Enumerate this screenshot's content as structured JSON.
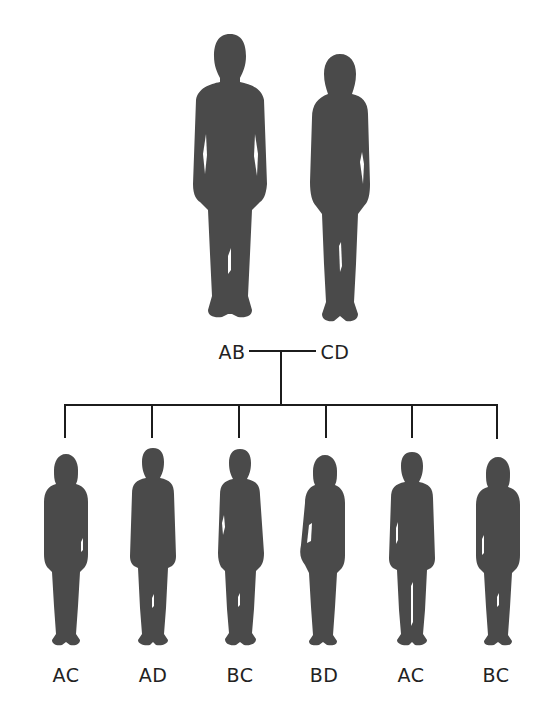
{
  "colors": {
    "silhouette": "#4a4a4a",
    "line": "#1c1c1c",
    "text": "#222222",
    "background": "#ffffff"
  },
  "parents": {
    "father": {
      "icon": "male-adult-silhouette",
      "genotype": "AB"
    },
    "mother": {
      "icon": "female-adult-silhouette",
      "genotype": "CD"
    }
  },
  "children": [
    {
      "icon": "girl-silhouette",
      "genotype": "AC"
    },
    {
      "icon": "boy-silhouette",
      "genotype": "AD"
    },
    {
      "icon": "boy-silhouette",
      "genotype": "BC"
    },
    {
      "icon": "girl-silhouette",
      "genotype": "BD"
    },
    {
      "icon": "boy-silhouette",
      "genotype": "AC"
    },
    {
      "icon": "girl-silhouette",
      "genotype": "BC"
    }
  ]
}
